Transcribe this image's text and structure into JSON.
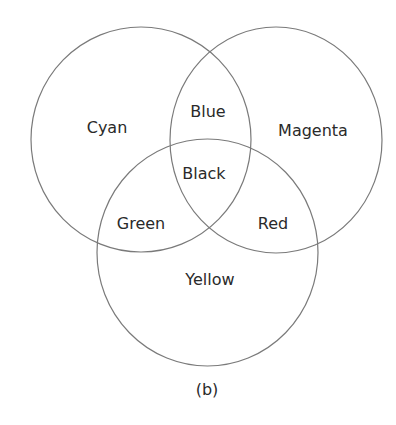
{
  "diagram": {
    "type": "venn",
    "sets": [
      {
        "id": "cyan",
        "label": "Cyan"
      },
      {
        "id": "magenta",
        "label": "Magenta"
      },
      {
        "id": "yellow",
        "label": "Yellow"
      }
    ],
    "regions": {
      "cyan_only": "Cyan",
      "magenta_only": "Magenta",
      "yellow_only": "Yellow",
      "cyan_magenta": "Blue",
      "cyan_yellow": "Green",
      "magenta_yellow": "Red",
      "all": "Black"
    },
    "caption": "(b)"
  },
  "colors": {
    "stroke": "#7a7a7a",
    "text": "#2a2a2a",
    "background": "#ffffff"
  }
}
